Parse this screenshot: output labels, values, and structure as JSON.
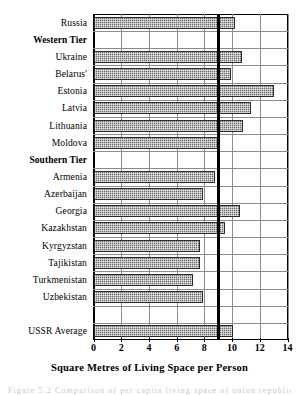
{
  "chart_data": {
    "type": "bar",
    "orientation": "horizontal",
    "title": "",
    "xlabel": "Square Metres of Living Space per Person",
    "ylabel": "",
    "xlim": [
      0,
      14
    ],
    "xticks": [
      0,
      2,
      4,
      6,
      8,
      10,
      12,
      14
    ],
    "xticklabels": [
      "0",
      "2",
      "4",
      "6",
      "8",
      "10",
      "12",
      "14"
    ],
    "grid": true,
    "legend": "none",
    "reference_line": {
      "value": 9.0,
      "label": "",
      "color": "#000000"
    },
    "bar_color": "#6d6d6d",
    "categories": [
      "Russia",
      "Western Tier",
      "Ukraine",
      "Belarus'",
      "Estonia",
      "Latvia",
      "Lithuania",
      "Moldova",
      "Southern Tier",
      "Armenia",
      "Azerbaijan",
      "Georgia",
      "Kazakhstan",
      "Kyrgyzstan",
      "Tajikistan",
      "Turkmenistan",
      "Uzbekistan",
      "",
      "USSR Average"
    ],
    "values": [
      10.2,
      null,
      10.7,
      9.9,
      13.0,
      11.4,
      10.8,
      9.1,
      null,
      8.8,
      7.9,
      10.6,
      9.5,
      7.7,
      7.7,
      7.2,
      7.9,
      null,
      10.1
    ],
    "rows": [
      {
        "label": "Russia",
        "value": 10.2,
        "header": false
      },
      {
        "label": "Western Tier",
        "value": null,
        "header": true
      },
      {
        "label": "Ukraine",
        "value": 10.7,
        "header": false
      },
      {
        "label": "Belarus'",
        "value": 9.9,
        "header": false
      },
      {
        "label": "Estonia",
        "value": 13.0,
        "header": false
      },
      {
        "label": "Latvia",
        "value": 11.4,
        "header": false
      },
      {
        "label": "Lithuania",
        "value": 10.8,
        "header": false
      },
      {
        "label": "Moldova",
        "value": 9.1,
        "header": false
      },
      {
        "label": "Southern Tier",
        "value": null,
        "header": true
      },
      {
        "label": "Armenia",
        "value": 8.8,
        "header": false
      },
      {
        "label": "Azerbaijan",
        "value": 7.9,
        "header": false
      },
      {
        "label": "Georgia",
        "value": 10.6,
        "header": false
      },
      {
        "label": "Kazakhstan",
        "value": 9.5,
        "header": false
      },
      {
        "label": "Kyrgyzstan",
        "value": 7.7,
        "header": false
      },
      {
        "label": "Tajikistan",
        "value": 7.7,
        "header": false
      },
      {
        "label": "Turkmenistan",
        "value": 7.2,
        "header": false
      },
      {
        "label": "Uzbekistan",
        "value": 7.9,
        "header": false
      },
      {
        "label": "",
        "value": null,
        "header": false
      },
      {
        "label": "USSR Average",
        "value": 10.1,
        "header": false
      }
    ]
  },
  "caption": {
    "text": "Figure 5.2  Comparison of per capita living space of union republics"
  }
}
